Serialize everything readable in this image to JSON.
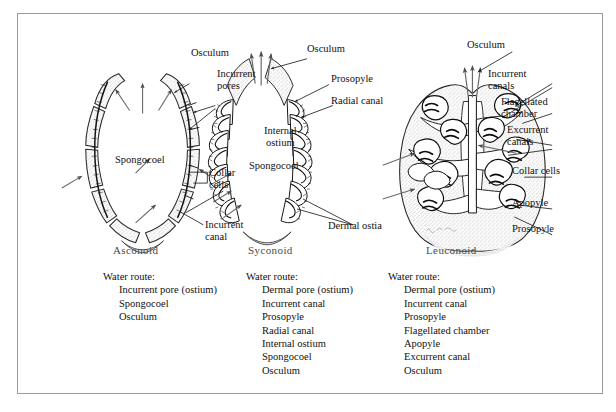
{
  "figure": {
    "background_color": "#ffffff",
    "border_color": "#9a9a9a",
    "ink_color": "#111111",
    "type_name_color": "#4a4a4a",
    "artist_signature": "W. C. Ober"
  },
  "asconoid": {
    "type_name": "Asconoid",
    "labels": {
      "osculum": "Osculum",
      "incurrent_pores": "Incurrent\npores",
      "spongocoel": "Spongocoel",
      "collar_cells": "Collar\ncells",
      "incurrent_canal": "Incurrent\ncanal"
    },
    "water_route": {
      "heading": "Water route:",
      "steps": [
        "Incurrent pore (ostium)",
        "Spongocoel",
        "Osculum"
      ]
    }
  },
  "syconoid": {
    "type_name": "Syconoid",
    "labels": {
      "osculum": "Osculum",
      "prosopyle": "Prosopyle",
      "radial_canal": "Radial canal",
      "internal_ostium": "Internal\nostium",
      "spongocoel": "Spongocoel",
      "dermal_ostia": "Dermal ostia"
    },
    "water_route": {
      "heading": "Water route:",
      "steps": [
        "Dermal pore (ostium)",
        "Incurrent canal",
        "Prosopyle",
        "Radial canal",
        "Internal ostium",
        "Spongocoel",
        "Osculum"
      ]
    }
  },
  "leuconoid": {
    "type_name": "Leuconoid",
    "labels": {
      "osculum": "Osculum",
      "incurrent_canals": "Incurrent\ncanals",
      "flagellated_chamber": "Flagellated\nchamber",
      "excurrent_canals": "Excurrent\ncanals",
      "collar_cells": "Collar cells",
      "apopyle": "Apopyle",
      "prosopyle": "Prosopyle"
    },
    "water_route": {
      "heading": "Water route:",
      "steps": [
        "Dermal pore (ostium)",
        "Incurrent canal",
        "Prosopyle",
        "Flagellated chamber",
        "Apopyle",
        "Excurrent canal",
        "Osculum"
      ]
    }
  }
}
